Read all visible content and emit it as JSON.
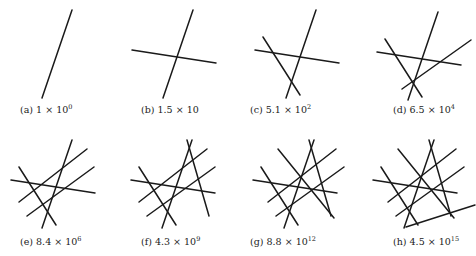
{
  "figure": {
    "panels": [
      {
        "id": "a",
        "label": "(a)",
        "mantissa": "1 × 10",
        "exponent": "0",
        "num_lines": 1
      },
      {
        "id": "b",
        "label": "(b)",
        "mantissa": "1.5 × 10",
        "exponent": "",
        "num_lines": 2
      },
      {
        "id": "c",
        "label": "(c)",
        "mantissa": "5.1 × 10",
        "exponent": "2",
        "num_lines": 3
      },
      {
        "id": "d",
        "label": "(d)",
        "mantissa": "6.5 × 10",
        "exponent": "4",
        "num_lines": 4
      },
      {
        "id": "e",
        "label": "(e)",
        "mantissa": "8.4 × 10",
        "exponent": "6",
        "num_lines": 5
      },
      {
        "id": "f",
        "label": "(f)",
        "mantissa": "4.3 × 10",
        "exponent": "9",
        "num_lines": 6
      },
      {
        "id": "g",
        "label": "(g)",
        "mantissa": "8.8 × 10",
        "exponent": "12",
        "num_lines": 7
      },
      {
        "id": "h",
        "label": "(h)",
        "mantissa": "4.5 × 10",
        "exponent": "15",
        "num_lines": 8
      }
    ],
    "line_color": "#1a1a1a"
  }
}
